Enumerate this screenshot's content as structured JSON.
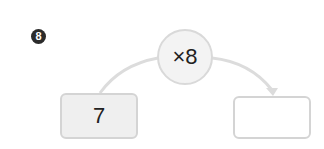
{
  "problem": {
    "number": "8"
  },
  "operator": {
    "label": "×8"
  },
  "input_box": {
    "value": "7"
  },
  "output_box": {
    "value": ""
  },
  "colors": {
    "badge": "#2b2b2b",
    "stroke": "#d9d9d9",
    "input_fill": "#efefef",
    "operator_fill": "#f3f3f3"
  }
}
